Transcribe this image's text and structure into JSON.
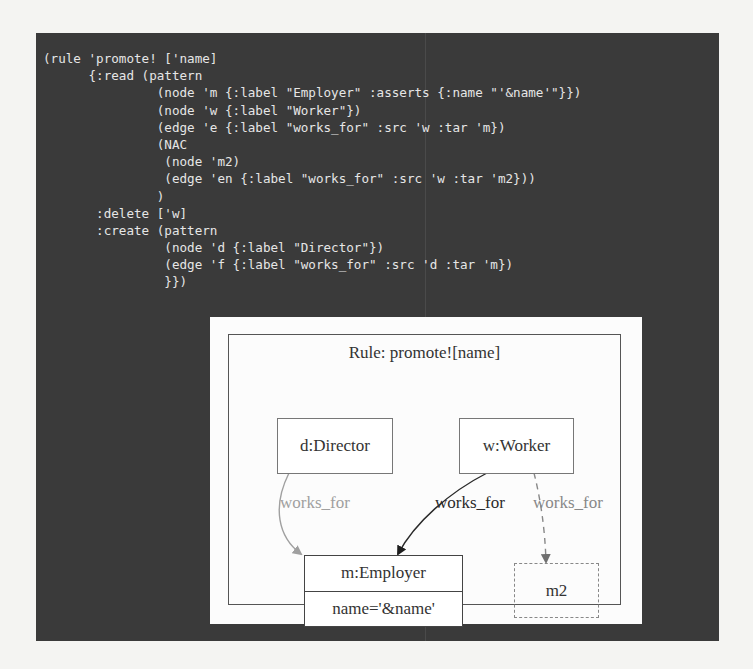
{
  "code_editor": {
    "lines": [
      "(rule 'promote! ['name]",
      "      {:read (pattern",
      "               (node 'm {:label \"Employer\" :asserts {:name \"'&name'\"}})",
      "               (node 'w {:label \"Worker\"})",
      "               (edge 'e {:label \"works_for\" :src 'w :tar 'm})",
      "               (NAC",
      "                (node 'm2)",
      "                (edge 'en {:label \"works_for\" :src 'w :tar 'm2}))",
      "               )",
      "       :delete ['w]",
      "       :create (pattern",
      "                (node 'd {:label \"Director\"})",
      "                (edge 'f {:label \"works_for\" :src 'd :tar 'm})",
      "                }})"
    ]
  },
  "diagram": {
    "title": "Rule: promote![name]",
    "nodes": [
      {
        "id": "d",
        "label": "d:Director",
        "style": "created"
      },
      {
        "id": "w",
        "label": "w:Worker",
        "style": "deleted"
      },
      {
        "id": "m",
        "label": "m:Employer",
        "attribute": "name='&name'",
        "style": "read"
      },
      {
        "id": "m2",
        "label": "m2",
        "style": "nac"
      }
    ],
    "edges": [
      {
        "src": "d",
        "tar": "m",
        "label": "works_for",
        "style": "created",
        "color": "#a0a0a0"
      },
      {
        "src": "w",
        "tar": "m",
        "label": "works_for",
        "style": "read",
        "color": "#2a2a2a"
      },
      {
        "src": "w",
        "tar": "m2",
        "label": "works_for",
        "style": "nac-dashed",
        "color": "#888888"
      }
    ]
  },
  "colors": {
    "editor_bg": "#3a3a3a",
    "editor_text": "#e6e6e6",
    "diagram_bg": "#fcfcfc"
  }
}
